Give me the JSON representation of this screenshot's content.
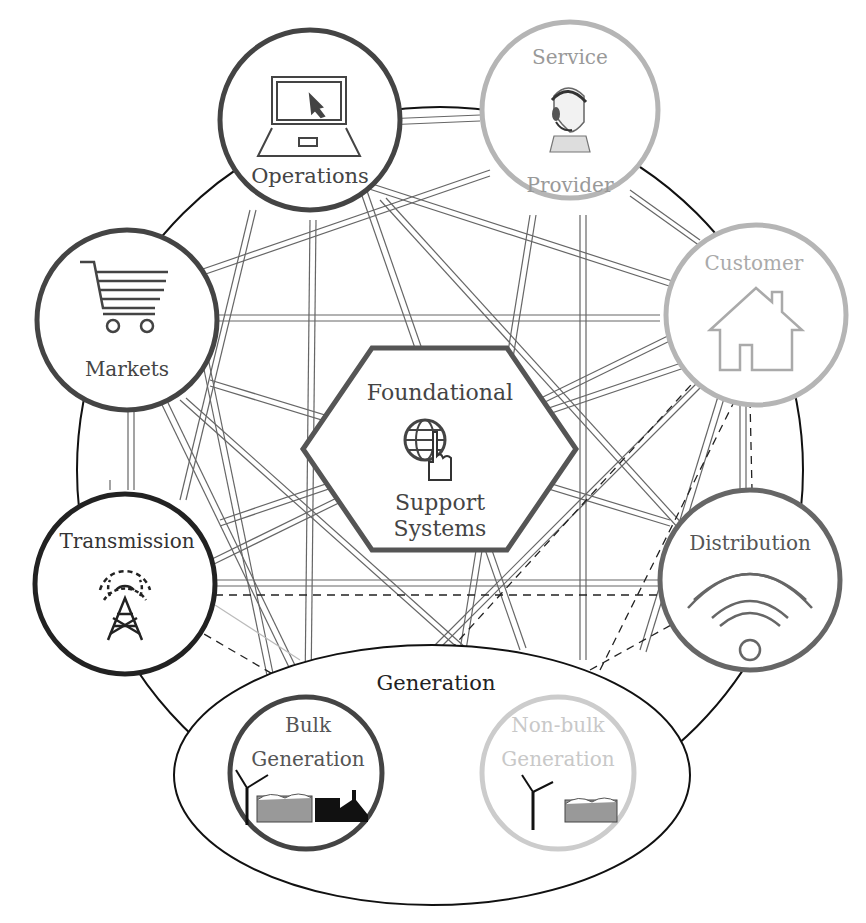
{
  "diagram": {
    "type": "smart-grid-domain-interconnection",
    "colors": {
      "dark": "#3a3a3a",
      "medium": "#555555",
      "light": "#b5b5b5",
      "black": "#111111"
    },
    "center": {
      "title_line1": "Foundational",
      "title_line2": "Support",
      "title_line3": "Systems",
      "icon": "globe-touch-icon"
    },
    "nodes": {
      "operations": {
        "label": "Operations",
        "icon": "laptop-icon"
      },
      "service_provider": {
        "label_top": "Service",
        "label_bottom": "Provider",
        "icon": "headset-agent-icon"
      },
      "customer": {
        "label": "Customer",
        "icon": "house-icon"
      },
      "markets": {
        "label": "Markets",
        "icon": "shopping-cart-icon"
      },
      "transmission": {
        "label": "Transmission",
        "icon": "radio-tower-icon"
      },
      "distribution": {
        "label": "Distribution",
        "icon": "wifi-signal-icon"
      }
    },
    "generation": {
      "label": "Generation",
      "bulk": {
        "line1": "Bulk",
        "line2": "Generation",
        "icon": "wind-turbine-factory-icon"
      },
      "non_bulk": {
        "line1": "Non-bulk",
        "line2": "Generation",
        "icon": "wind-turbine-icon"
      }
    }
  }
}
